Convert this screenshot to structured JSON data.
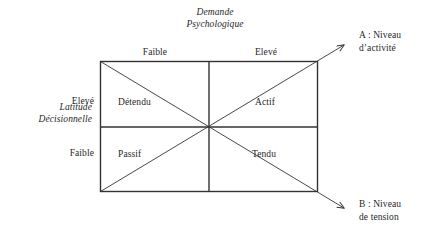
{
  "figure": {
    "type": "karasek-job-demand-control-model",
    "background_color": "#ffffff",
    "line_color": "#333333",
    "text_color": "#1f1f1f"
  },
  "axes": {
    "horizontal": {
      "title_line1": "Demande",
      "title_line2": "Psychologique",
      "levels": [
        "Faible",
        "Elevé"
      ]
    },
    "vertical": {
      "title_line1": "Latitude",
      "title_line2": "Décisionnelle",
      "levels": [
        "Elevé",
        "Faible"
      ]
    }
  },
  "quadrants": [
    {
      "id": "detendu",
      "label": "Détendu",
      "demand": "Faible",
      "latitude": "Elevé"
    },
    {
      "id": "actif",
      "label": "Actif",
      "demand": "Elevé",
      "latitude": "Elevé"
    },
    {
      "id": "passif",
      "label": "Passif",
      "demand": "Faible",
      "latitude": "Faible"
    },
    {
      "id": "tendu",
      "label": "Tendu",
      "demand": "Elevé",
      "latitude": "Faible"
    }
  ],
  "diagonals": [
    {
      "id": "a",
      "caption_line1": "A : Niveau",
      "caption_line2": "d’activité",
      "direction": "bottom-left-to-top-right",
      "arrow": true
    },
    {
      "id": "b",
      "caption_line1": "B : Niveau",
      "caption_line2": "de tension",
      "direction": "top-left-to-bottom-right",
      "arrow": true
    }
  ]
}
